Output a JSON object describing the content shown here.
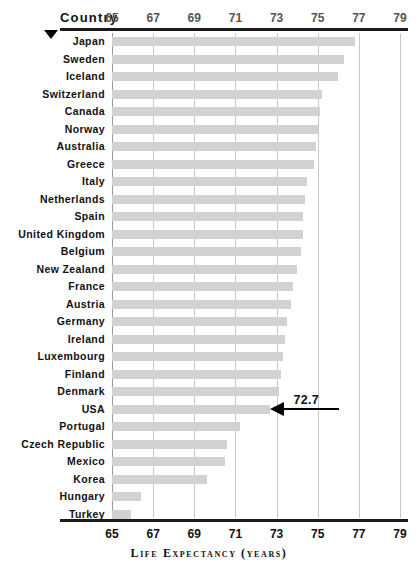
{
  "header": {
    "country_column_label": "Country",
    "marker_icon": "triangle-down-icon"
  },
  "axis": {
    "title": "Life Expectancy (years)",
    "ticks": [
      65,
      67,
      69,
      71,
      73,
      75,
      77,
      79
    ],
    "tick_labels": [
      "65",
      "67",
      "69",
      "71",
      "73",
      "75",
      "77",
      "79"
    ],
    "min": 65,
    "max": 79
  },
  "annotation": {
    "label": "72.7",
    "target_country": "USA",
    "arrow_icon": "arrow-left-icon"
  },
  "colors": {
    "bar": "#d2d2d2",
    "gridline": "#c8c8c8",
    "rule": "#1a1a1a",
    "text": "#111111",
    "tick_text_top": "#555555"
  },
  "chart_data": {
    "type": "bar",
    "orientation": "horizontal",
    "title": "",
    "xlabel": "Life Expectancy (years)",
    "ylabel": "Country",
    "xlim": [
      65,
      79
    ],
    "grid": true,
    "legend": "none",
    "categories": [
      "Japan",
      "Sweden",
      "Iceland",
      "Switzerland",
      "Canada",
      "Norway",
      "Australia",
      "Greece",
      "Italy",
      "Netherlands",
      "Spain",
      "United Kingdom",
      "Belgium",
      "New Zealand",
      "France",
      "Austria",
      "Germany",
      "Ireland",
      "Luxembourg",
      "Finland",
      "Denmark",
      "USA",
      "Portugal",
      "Czech Republic",
      "Mexico",
      "Korea",
      "Hungary",
      "Turkey"
    ],
    "values": [
      76.8,
      76.3,
      76.0,
      75.2,
      75.1,
      75.0,
      74.9,
      74.8,
      74.5,
      74.4,
      74.3,
      74.3,
      74.2,
      74.0,
      73.8,
      73.7,
      73.5,
      73.4,
      73.3,
      73.2,
      73.1,
      72.7,
      71.2,
      70.6,
      70.5,
      69.6,
      66.4,
      65.9
    ],
    "annotations": [
      {
        "category": "USA",
        "value": 72.7,
        "label": "72.7"
      }
    ]
  }
}
